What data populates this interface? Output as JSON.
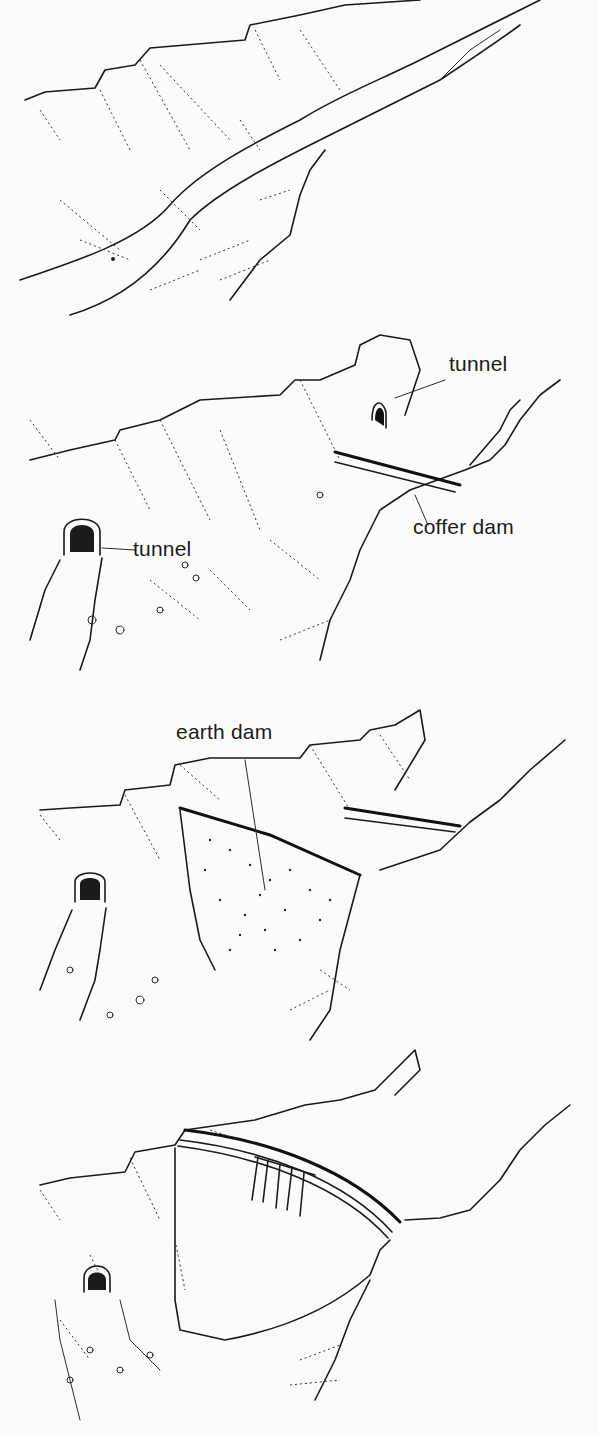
{
  "diagram": {
    "colors": {
      "ink": "#1a1a1a",
      "paper": "#fbfbfa"
    },
    "stages": [
      {
        "id": 1,
        "description": "Natural river valley",
        "labels": []
      },
      {
        "id": 2,
        "description": "Diversion tunnels and coffer dam",
        "labels": [
          {
            "text": "tunnel",
            "target": "upstream tunnel entrance (right bank)"
          },
          {
            "text": "coffer dam",
            "target": "temporary upstream barrier"
          },
          {
            "text": "tunnel",
            "target": "downstream tunnel outlet (left bank)"
          }
        ]
      },
      {
        "id": 3,
        "description": "Earth dam built between coffer dams",
        "labels": [
          {
            "text": "earth dam",
            "target": "fill across valley"
          }
        ]
      },
      {
        "id": 4,
        "description": "Completed concrete arch dam with spillway",
        "labels": []
      }
    ]
  }
}
